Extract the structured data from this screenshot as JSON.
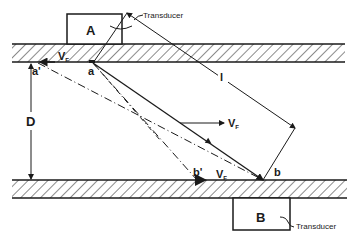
{
  "diagram": {
    "type": "ultrasonic transit-time flowmeter schematic",
    "transducer_a": {
      "label": "A",
      "callout": "Transducer"
    },
    "transducer_b": {
      "label": "B",
      "callout": "Transducer"
    },
    "points": {
      "a": "a",
      "a_prime": "a'",
      "b": "b",
      "b_prime": "b'"
    },
    "dimensions": {
      "diameter": "D",
      "path_length": "l"
    },
    "velocity": {
      "symbol": "V",
      "subscript": "F"
    },
    "colors": {
      "ink": "#1a1a1a",
      "background": "#ffffff"
    }
  }
}
